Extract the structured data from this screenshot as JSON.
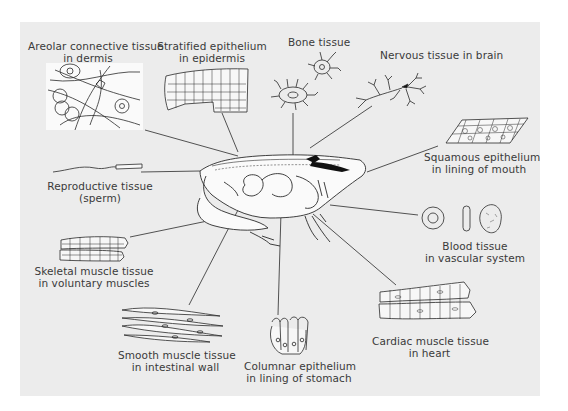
{
  "diagram": {
    "background_color": "#ececec",
    "line_color": "#2a2a2a",
    "center_figure": "frog-cross-section",
    "labels": [
      {
        "id": "areolar",
        "line1": "Areolar connective tissue",
        "line2": "in dermis"
      },
      {
        "id": "stratified",
        "line1": "Stratified epithelium",
        "line2": "in epidermis"
      },
      {
        "id": "bone",
        "line1": "Bone tissue",
        "line2": ""
      },
      {
        "id": "nervous",
        "line1": "Nervous tissue in brain",
        "line2": ""
      },
      {
        "id": "squamous",
        "line1": "Squamous epithelium",
        "line2": "in lining of mouth"
      },
      {
        "id": "reproductive",
        "line1": "Reproductive tissue",
        "line2": "(sperm)"
      },
      {
        "id": "blood",
        "line1": "Blood tissue",
        "line2": "in vascular system"
      },
      {
        "id": "skeletal",
        "line1": "Skeletal muscle tissue",
        "line2": "in voluntary muscles"
      },
      {
        "id": "smooth",
        "line1": "Smooth muscle tissue",
        "line2": "in intestinal wall"
      },
      {
        "id": "columnar",
        "line1": "Columnar epithelium",
        "line2": "in lining of stomach"
      },
      {
        "id": "cardiac",
        "line1": "Cardiac muscle tissue",
        "line2": "in heart"
      }
    ]
  }
}
